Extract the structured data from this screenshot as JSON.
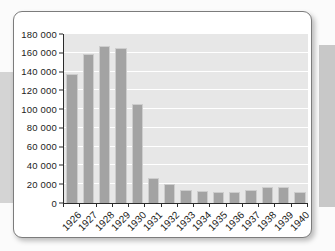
{
  "page": {
    "background": "#fbfbfb",
    "left_band_color": "#d4d4d4",
    "right_band_color": "#c8c8c8",
    "card_background": "#ffffff",
    "card_border_color": "#7c7c7c"
  },
  "chart_data": {
    "type": "bar",
    "title": "",
    "xlabel": "",
    "ylabel": "",
    "categories": [
      "1926",
      "1927",
      "1928",
      "1929",
      "1930",
      "1931",
      "1932",
      "1933",
      "1934",
      "1935",
      "1936",
      "1937",
      "1938",
      "1939",
      "1940"
    ],
    "values": [
      137000,
      159000,
      167000,
      165000,
      105000,
      27000,
      20000,
      14000,
      12500,
      11500,
      11500,
      14000,
      17000,
      17000,
      12000
    ],
    "ylim": [
      0,
      180000
    ],
    "ytick_interval": 20000,
    "ytick_labels": [
      "0",
      "20 000",
      "40 000",
      "60 000",
      "80 000",
      "100 000",
      "120 000",
      "140 000",
      "160 000",
      "180 000"
    ],
    "grid": "horizontal",
    "legend": "none",
    "plot_background": "#e7e7e7",
    "gridline_color": "#ffffff",
    "bar_fill": "#a3a3a3",
    "bar_border": "#cdcdcd",
    "axis_color": "#2b2b2b",
    "label_color": "#1c1c1c"
  }
}
